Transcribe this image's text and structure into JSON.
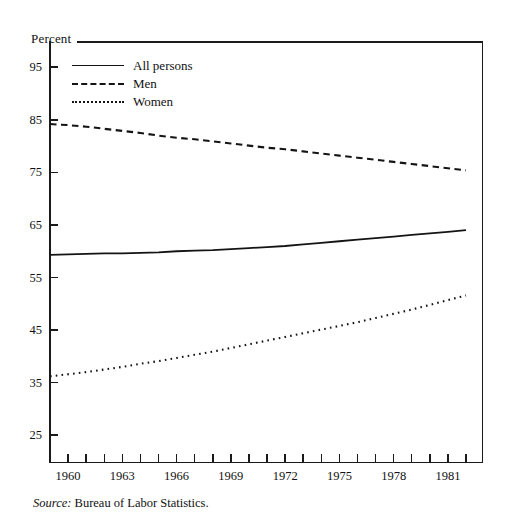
{
  "figure": {
    "y_axis_title": "Percent",
    "source_prefix": "Source:",
    "source_text": " Bureau of Labor Statistics."
  },
  "legend": {
    "items": [
      {
        "label": "All persons",
        "style": "solid",
        "swatch": "legend-line-solid-icon"
      },
      {
        "label": "Men",
        "style": "dashed",
        "swatch": "legend-line-dashed-icon"
      },
      {
        "label": "Women",
        "style": "dotted",
        "swatch": "legend-line-dotted-icon"
      }
    ]
  },
  "chart_data": {
    "type": "line",
    "title": "",
    "subtitle": "",
    "xlabel": "",
    "ylabel": "Percent",
    "xlim": [
      1959,
      1982
    ],
    "ylim": [
      20,
      100
    ],
    "ytick_labels": [
      "95",
      "85",
      "75",
      "65",
      "55",
      "45",
      "35",
      "25"
    ],
    "ytick_values": [
      95,
      85,
      75,
      65,
      55,
      45,
      35,
      25
    ],
    "xtick_labels": [
      "1960",
      "1963",
      "1966",
      "1969",
      "1972",
      "1975",
      "1978",
      "1981"
    ],
    "xtick_values": [
      1960,
      1963,
      1966,
      1969,
      1972,
      1975,
      1978,
      1981
    ],
    "x_minor_ticks": [
      1959,
      1960,
      1961,
      1962,
      1963,
      1964,
      1965,
      1966,
      1967,
      1968,
      1969,
      1970,
      1971,
      1972,
      1973,
      1974,
      1975,
      1976,
      1977,
      1978,
      1979,
      1980,
      1981,
      1982
    ],
    "grid": false,
    "legend_position": "upper-left-inside",
    "x": [
      1959,
      1960,
      1961,
      1962,
      1963,
      1964,
      1965,
      1966,
      1967,
      1968,
      1969,
      1970,
      1971,
      1972,
      1973,
      1974,
      1975,
      1976,
      1977,
      1978,
      1979,
      1980,
      1981,
      1982
    ],
    "series": [
      {
        "name": "All persons",
        "style": "solid",
        "color": "#141414",
        "values": [
          59.3,
          59.4,
          59.5,
          59.6,
          59.6,
          59.7,
          59.8,
          60.0,
          60.1,
          60.2,
          60.4,
          60.6,
          60.8,
          61.0,
          61.3,
          61.6,
          61.9,
          62.2,
          62.5,
          62.8,
          63.1,
          63.4,
          63.7,
          64.0
        ]
      },
      {
        "name": "Men",
        "style": "dashed",
        "color": "#141414",
        "values": [
          84.2,
          84.0,
          83.7,
          83.3,
          82.9,
          82.5,
          82.0,
          81.6,
          81.3,
          80.9,
          80.5,
          80.1,
          79.7,
          79.4,
          79.0,
          78.6,
          78.2,
          77.8,
          77.4,
          77.0,
          76.6,
          76.2,
          75.8,
          75.4
        ]
      },
      {
        "name": "Women",
        "style": "dotted",
        "color": "#141414",
        "values": [
          36.2,
          36.6,
          37.0,
          37.5,
          38.0,
          38.6,
          39.1,
          39.7,
          40.3,
          40.9,
          41.6,
          42.3,
          43.0,
          43.7,
          44.4,
          45.1,
          45.8,
          46.5,
          47.3,
          48.1,
          48.9,
          49.8,
          50.7,
          51.6
        ]
      }
    ]
  }
}
